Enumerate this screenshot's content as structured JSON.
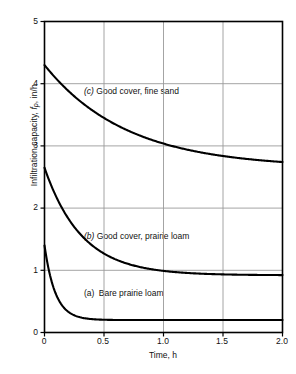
{
  "chart_data": {
    "type": "line",
    "title": "",
    "xlabel": "Time, h",
    "ylabel_parts": {
      "prefix": "Infiltration capacity, ",
      "symbol": "f",
      "subscript": "p",
      "suffix": ", in/h"
    },
    "ylabel": "Infiltration capacity, f_p, in/h",
    "xlim": [
      0,
      2.0
    ],
    "ylim": [
      0,
      5
    ],
    "xticks": [
      "0",
      "0.5",
      "1.0",
      "1.5",
      "2.0"
    ],
    "xtick_values": [
      0,
      0.5,
      1.0,
      1.5,
      2.0
    ],
    "yticks": [
      "0",
      "1",
      "2",
      "3",
      "4",
      "5"
    ],
    "ytick_values": [
      0,
      1,
      2,
      3,
      4,
      5
    ],
    "grid": true,
    "grid_color": "#9a9a9a",
    "axis_color": "#000000",
    "curve_color": "#000000",
    "legend_position": "inline-annotations",
    "series": [
      {
        "key": "a",
        "name": "(a)  Bare prairie loam",
        "label_marker": "(a)",
        "label_text": "Bare prairie loam",
        "f0": 1.4,
        "fc": 0.2,
        "k": 11.0,
        "x": [
          0,
          0.05,
          0.1,
          0.15,
          0.2,
          0.25,
          0.3,
          0.4,
          0.5,
          0.6,
          0.75,
          1.0,
          1.25,
          1.5,
          1.75,
          2.0
        ],
        "values": [
          1.4,
          0.89,
          0.6,
          0.44,
          0.34,
          0.28,
          0.25,
          0.22,
          0.21,
          0.2,
          0.2,
          0.2,
          0.2,
          0.2,
          0.2,
          0.2
        ]
      },
      {
        "key": "b",
        "name": "(b) Good cover, prairie loam",
        "label_marker": "(b)",
        "label_text": "Good cover, prairie loam",
        "f0": 2.65,
        "fc": 0.92,
        "k": 3.2,
        "x": [
          0,
          0.05,
          0.1,
          0.15,
          0.2,
          0.3,
          0.4,
          0.5,
          0.6,
          0.75,
          0.9,
          1.0,
          1.25,
          1.5,
          1.75,
          2.0
        ],
        "values": [
          2.65,
          2.4,
          2.18,
          1.99,
          1.83,
          1.58,
          1.4,
          1.27,
          1.18,
          1.08,
          1.02,
          0.99,
          0.95,
          0.93,
          0.92,
          0.92
        ]
      },
      {
        "key": "c",
        "name": "(c) Good cover, fine sand",
        "label_marker": "(c)",
        "label_text": "Good cover, fine sand",
        "f0": 4.3,
        "fc": 2.65,
        "k": 1.45,
        "x": [
          0,
          0.1,
          0.2,
          0.3,
          0.4,
          0.5,
          0.6,
          0.75,
          0.9,
          1.0,
          1.2,
          1.4,
          1.5,
          1.75,
          2.0
        ],
        "values": [
          4.3,
          4.08,
          3.89,
          3.72,
          3.57,
          3.44,
          3.33,
          3.19,
          3.07,
          3.0,
          2.9,
          2.83,
          2.8,
          2.73,
          2.7
        ]
      }
    ],
    "annotations": [
      {
        "key": "c",
        "marker": "(c)",
        "text": "Good cover, fine sand",
        "x": 0.35,
        "y": 3.73
      },
      {
        "key": "b",
        "marker": "(b)",
        "text": "Good cover, prairie loam",
        "x": 0.35,
        "y": 1.56
      },
      {
        "key": "a",
        "marker": "(a)",
        "text": "Bare prairie loam",
        "x": 0.35,
        "y": 0.64
      }
    ]
  }
}
